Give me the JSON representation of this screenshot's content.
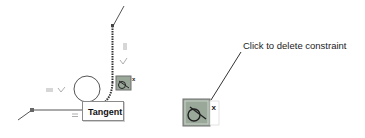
{
  "sketch": {
    "tooltip_label": "Tangent",
    "constraint_type": "tangent",
    "symbols": [
      "=",
      "=",
      "=",
      "perpendicular",
      "perpendicular"
    ]
  },
  "callout": {
    "text": "Click to delete constraint"
  },
  "icons": {
    "small_constraint": "tangent-constraint-icon",
    "large_constraint": "tangent-constraint-icon",
    "delete": "close-icon"
  },
  "colors": {
    "line": "#555555",
    "icon_bg": "#9aa89a",
    "icon_border": "#6f6f6f",
    "text": "#222222"
  }
}
